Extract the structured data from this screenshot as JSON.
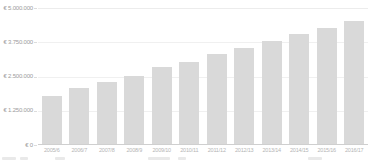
{
  "chart_data": {
    "type": "bar",
    "title": "",
    "xlabel": "",
    "ylabel": "",
    "legend_position": "none",
    "grid": "faint-horizontal",
    "categories": [
      "2005/6",
      "2006/7",
      "2007/8",
      "2008/9",
      "2009/10",
      "2010/11",
      "2011/12",
      "2012/13",
      "2013/14",
      "2014/15",
      "2015/16",
      "2016/17"
    ],
    "values": [
      1750000,
      2050000,
      2250000,
      2500000,
      2800000,
      3000000,
      3300000,
      3500000,
      3750000,
      4000000,
      4250000,
      4500000
    ],
    "y_axis": {
      "tick_labels": [
        "€ 5.000.000",
        "€ 3.750.000",
        "€ 2.500.000",
        "€ 1.250.000",
        "€ 0"
      ],
      "min": 0,
      "max": 5000000,
      "step": 1250000
    },
    "colors": {
      "bar": "#d9d9d9",
      "baseline": "#cfcfcf",
      "gridline": "#f0f0f0",
      "y_tick_label": "#9c9c9c",
      "x_tick_label": "#b5b5b5",
      "background": "#ffffff"
    }
  }
}
